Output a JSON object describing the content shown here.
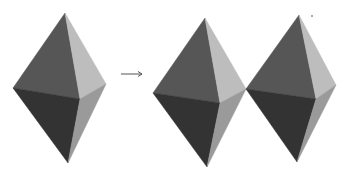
{
  "diagram": {
    "colors": {
      "upper_left": "#565656",
      "upper_right": "#bdbdbd",
      "lower_left": "#333333",
      "lower_right": "#9a9a9a",
      "arrow": "#555555"
    },
    "shapes": [
      {
        "name": "bipyramid-original",
        "top": [
          65,
          13
        ],
        "left": [
          13,
          88
        ],
        "right": [
          106,
          84
        ],
        "center": [
          80,
          99
        ],
        "bottom": [
          68,
          163
        ]
      },
      {
        "name": "bipyramid-copy-1",
        "top": [
          205,
          18
        ],
        "left": [
          153,
          93
        ],
        "right": [
          246,
          89
        ],
        "center": [
          220,
          103
        ],
        "bottom": [
          207,
          167
        ]
      },
      {
        "name": "bipyramid-copy-2",
        "top": [
          299,
          15
        ],
        "left": [
          246,
          89
        ],
        "right": [
          336,
          85
        ],
        "center": [
          316,
          99
        ],
        "bottom": [
          297,
          162
        ]
      }
    ],
    "arrow": {
      "from": [
        121,
        74
      ],
      "to": [
        142,
        74
      ]
    }
  }
}
